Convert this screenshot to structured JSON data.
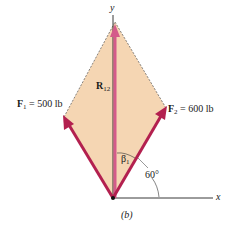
{
  "figure": {
    "caption": "(b)",
    "axes": {
      "y_label": "y",
      "x_label": "x"
    },
    "forces": {
      "f1": {
        "symbol": "F",
        "subscript": "1",
        "value": "= 500 lb"
      },
      "f2": {
        "symbol": "F",
        "subscript": "2",
        "value": "= 600 lb"
      },
      "resultant": {
        "symbol": "R",
        "subscript": "12"
      }
    },
    "angles": {
      "beta": {
        "symbol": "β",
        "subscript": "1"
      },
      "f2_angle": "60°"
    },
    "colors": {
      "parallelogram_fill": "#f5d6b3",
      "force_arrow": "#b3204f",
      "resultant_arrow": "#d45b8a",
      "axis": "#222222"
    }
  }
}
